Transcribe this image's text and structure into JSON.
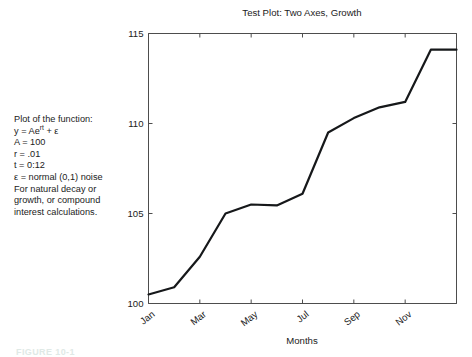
{
  "figure": {
    "caption_partial": "FIGURE 10-1"
  },
  "annotation": {
    "lines": [
      "Plot of the function:",
      "A = 100",
      "r = .01",
      "t = 0:12",
      "ε = normal (0,1) noise",
      "For natural decay or",
      "growth, or compound",
      "interest calculations."
    ],
    "formula_prefix": "y = Ae",
    "formula_exponent": "rt",
    "formula_suffix": " + ε"
  },
  "chart_data": {
    "type": "line",
    "title": "Test Plot: Two Axes, Growth",
    "xlabel": "Months",
    "ylabel": "",
    "xlim": [
      0,
      12
    ],
    "ylim": [
      100,
      115
    ],
    "grid": false,
    "legend": null,
    "x": [
      0,
      1,
      2,
      3,
      4,
      5,
      6,
      7,
      8,
      9,
      10,
      11,
      12
    ],
    "categories": [
      "Jan",
      "Feb",
      "Mar",
      "Apr",
      "May",
      "Jun",
      "Jul",
      "Aug",
      "Sep",
      "Oct",
      "Nov",
      "Dec",
      "Jan"
    ],
    "values": [
      100.5,
      100.9,
      102.6,
      105.0,
      105.5,
      105.45,
      106.1,
      109.5,
      110.3,
      110.9,
      111.2,
      114.1,
      114.1
    ],
    "series": [
      {
        "name": "y = Ae^rt + noise",
        "color": "#16181a",
        "values": [
          100.5,
          100.9,
          102.6,
          105.0,
          105.5,
          105.45,
          106.1,
          109.5,
          110.3,
          110.9,
          111.2,
          114.1,
          114.1
        ]
      }
    ],
    "yticks": [
      100,
      105,
      110,
      115
    ],
    "yticklabels": [
      "100",
      "105",
      "110",
      "115"
    ],
    "xticks": [
      0,
      2,
      4,
      6,
      8,
      10
    ],
    "xticklabels": [
      "Jan",
      "Mar",
      "May",
      "Jul",
      "Sep",
      "Nov"
    ],
    "xticklabel_rotation": -38,
    "line_color": "#16181a",
    "axis_color": "#4d4d4d"
  }
}
